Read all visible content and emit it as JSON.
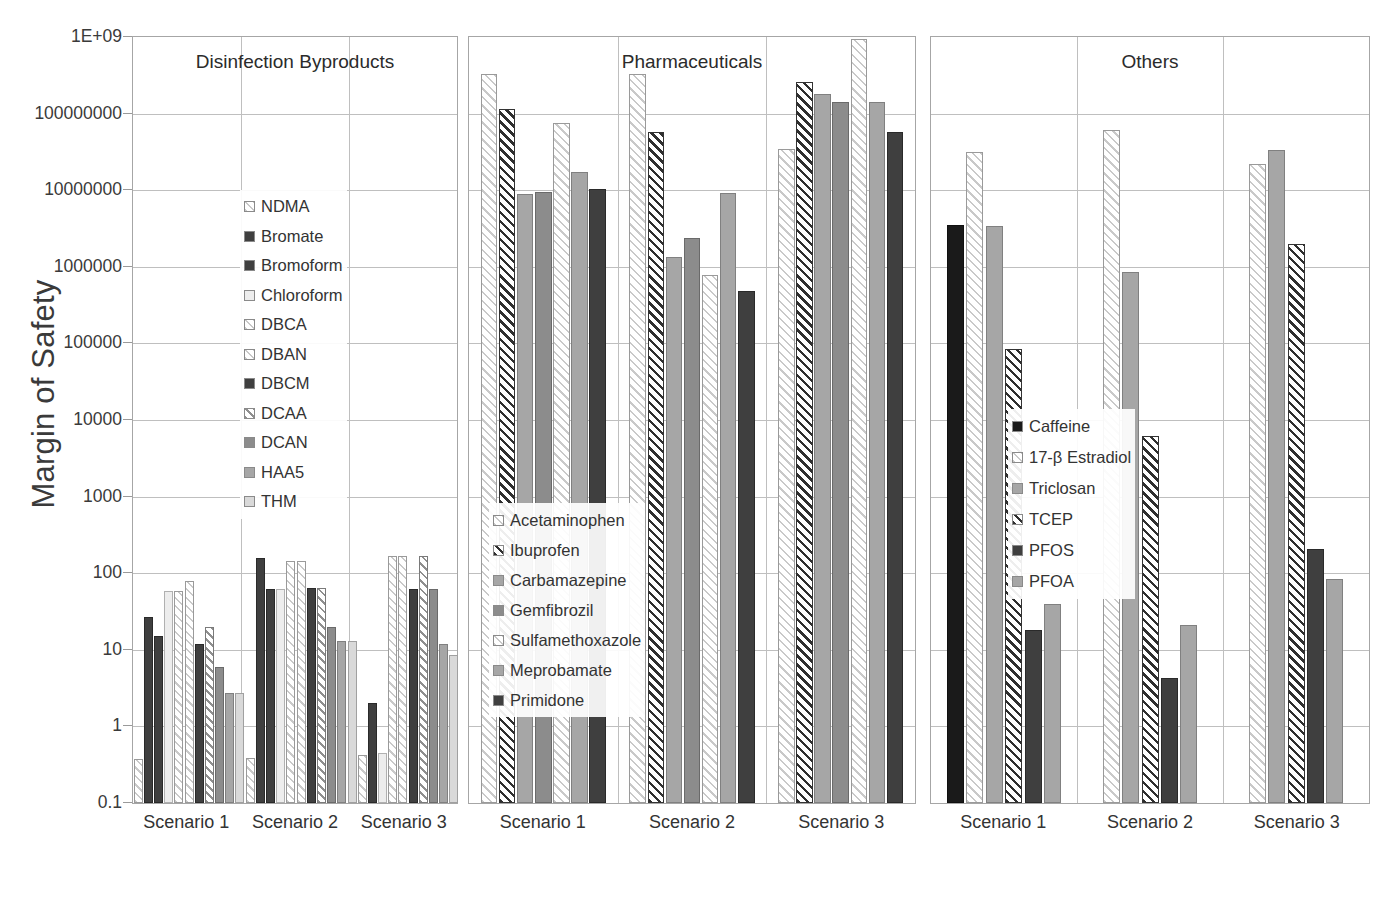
{
  "chart_data": {
    "type": "bar",
    "title": "",
    "xlabel": "",
    "ylabel": "Margin of Safety",
    "yscale": "log",
    "ylim": [
      0.1,
      1000000000
    ],
    "ytick_labels": [
      "1E+09",
      "100000000",
      "10000000",
      "1000000",
      "100000",
      "10000",
      "1000",
      "100",
      "10",
      "1",
      "0.1"
    ],
    "ytick_values": [
      1000000000,
      100000000,
      10000000,
      1000000,
      100000,
      10000,
      1000,
      100,
      10,
      1,
      0.1
    ],
    "grid": true,
    "legend_position": "inside-panel",
    "categories": [
      "Scenario 1",
      "Scenario 2",
      "Scenario 3"
    ],
    "panels": [
      {
        "title": "Disinfection Byproducts",
        "series": [
          {
            "name": "NDMA",
            "fill": "f-hatch-light",
            "values": [
              0.38,
              0.39,
              0.42
            ]
          },
          {
            "name": "Bromate",
            "fill": "f-solid-dark",
            "values": [
              27,
              160,
              2.0
            ]
          },
          {
            "name": "Bromoform",
            "fill": "f-solid-dark",
            "values": [
              15,
              62,
              null
            ]
          },
          {
            "name": "Chloroform",
            "fill": "f-solid-vlight",
            "values": [
              58,
              62,
              0.45
            ]
          },
          {
            "name": "DBCA",
            "fill": "f-hatch-light",
            "values": [
              58,
              145,
              170
            ]
          },
          {
            "name": "DBAN",
            "fill": "f-hatch-light",
            "values": [
              80,
              145,
              170
            ]
          },
          {
            "name": "DBCM",
            "fill": "f-solid-dark",
            "values": [
              12,
              65,
              62
            ]
          },
          {
            "name": "DCAA",
            "fill": "f-hatch-mid",
            "values": [
              20,
              65,
              170
            ]
          },
          {
            "name": "DCAN",
            "fill": "f-solid-grey",
            "values": [
              6,
              20,
              62
            ]
          },
          {
            "name": "HAA5",
            "fill": "f-solid-mid",
            "values": [
              2.7,
              13,
              12
            ]
          },
          {
            "name": "THM",
            "fill": "f-solid-light",
            "values": [
              2.7,
              13,
              8.5
            ]
          }
        ]
      },
      {
        "title": "Pharmaceuticals",
        "series": [
          {
            "name": "Acetaminophen",
            "fill": "f-hatch-light",
            "values": [
              330000000,
              330000000,
              35000000
            ]
          },
          {
            "name": "Ibuprofen",
            "fill": "f-hatch-dark",
            "values": [
              115000000,
              58000000,
              260000000
            ]
          },
          {
            "name": "Carbamazepine",
            "fill": "f-solid-mid",
            "values": [
              9000000,
              1350000,
              180000000
            ]
          },
          {
            "name": "Gemfibrozil",
            "fill": "f-solid-grey",
            "values": [
              9500000,
              2400000,
              140000000
            ]
          },
          {
            "name": "Sulfamethoxazole",
            "fill": "f-hatch-light",
            "values": [
              75000000,
              780000,
              950000000
            ]
          },
          {
            "name": "Meprobamate",
            "fill": "f-solid-mid",
            "values": [
              17500000,
              9200000,
              140000000
            ]
          },
          {
            "name": "Primidone",
            "fill": "f-solid-dark",
            "values": [
              10500000,
              480000,
              58000000
            ]
          }
        ]
      },
      {
        "title": "Others",
        "series": [
          {
            "name": "Caffeine",
            "fill": "f-solid-black",
            "values": [
              3500000,
              null,
              null
            ]
          },
          {
            "name": "17-β Estradiol",
            "fill": "f-hatch-light",
            "values": [
              32000000,
              62000000,
              22000000
            ]
          },
          {
            "name": "Triclosan",
            "fill": "f-solid-mid",
            "values": [
              3400000,
              850000,
              33000000
            ]
          },
          {
            "name": "TCEP",
            "fill": "f-hatch-dark",
            "values": [
              85000,
              6200,
              2000000
            ]
          },
          {
            "name": "PFOS",
            "fill": "f-solid-dark",
            "values": [
              18,
              4.3,
              210
            ]
          },
          {
            "name": "PFOA",
            "fill": "f-solid-mid",
            "values": [
              40,
              21,
              85
            ]
          }
        ]
      }
    ]
  }
}
